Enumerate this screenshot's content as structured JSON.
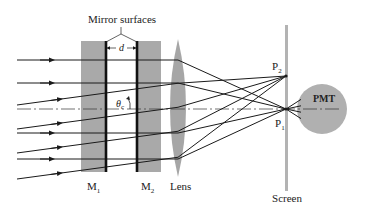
{
  "diagram": {
    "type": "optical-setup",
    "colors": {
      "ink": "#1a1a1a",
      "mirror_block": "#a9a9a9",
      "lens": "#a6a6a6",
      "screen": "#b3b3b3",
      "pmt": "#b0b0b0"
    },
    "labels": {
      "mirror_surfaces": "Mirror surfaces",
      "spacing": "d",
      "angle": "θ",
      "angle_sub": "c",
      "m1": "M",
      "m1_sub": "1",
      "m2": "M",
      "m2_sub": "2",
      "lens": "Lens",
      "p2": "P",
      "p2_sub": "2",
      "p1": "P",
      "p1_sub": "1",
      "pmt": "PMT",
      "screen": "Screen"
    },
    "ray_groups": [
      {
        "name": "on-axis-parallel",
        "focus": "P1",
        "count": 4
      },
      {
        "name": "tilted-parallel",
        "focus": "P2",
        "count": 4
      }
    ]
  }
}
